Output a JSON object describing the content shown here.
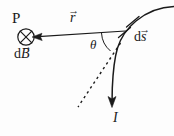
{
  "figure": {
    "kind": "physics-vector-diagram",
    "width": 174,
    "height": 136,
    "background_color": "#fdfdfd",
    "stroke_color": "#1a1a1a",
    "labels": {
      "point_p": "P",
      "field_element": "d",
      "field_element_symbol": "B",
      "field_element_vector_mark": "→",
      "displacement_symbol": "r",
      "displacement_vector_mark": "→",
      "angle": "θ",
      "current_element": "d",
      "current_element_symbol": "s",
      "current_element_vector_mark": "→",
      "current": "I"
    },
    "elements": {
      "cross_circle": "circle-with-cross-into-page",
      "r_vector": "arrow-from-wire-to-point-p",
      "wire": "curved-current-carrying-wire",
      "current_arrow": "downward-arrow-on-wire",
      "dashed_tangent": "dashed-tangent-line",
      "angle_arc": "arc-between-r-and-tangent",
      "tick_marks": "two-hash-marks-on-wire"
    }
  }
}
